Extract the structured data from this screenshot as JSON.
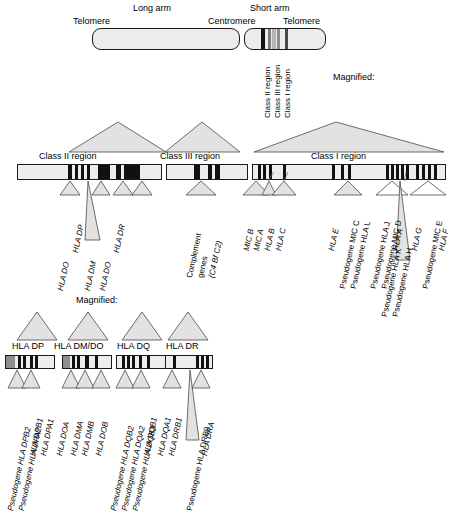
{
  "figure": {
    "title_words": {
      "magnified_1": "Magnified:",
      "magnified_2": "Magnified:"
    }
  },
  "chromosome": {
    "labels": {
      "long_arm": "Long arm",
      "short_arm": "Short arm",
      "telomere_left": "Telomere",
      "centromere": "Centromere",
      "telomere_right": "Telomere"
    },
    "band_labels": [
      "Class II region",
      "Class III region",
      "Class I region"
    ]
  },
  "regions": {
    "class_ii": {
      "title": "Class II region",
      "genes": [
        "HLA DO",
        "HLA DP",
        "HLA DM",
        "HLA DO",
        "HLA DR"
      ]
    },
    "class_iii": {
      "title": "Class III region",
      "genes": [
        "Complement genes (C4 Bf C2)"
      ],
      "gene_line1": "Complement",
      "gene_line2": "genes",
      "gene_line3": "(C4 Bf C2)"
    },
    "class_i": {
      "title": "Class I region",
      "genes": [
        "MIC B",
        "MIC A",
        "HLA B",
        "HLA C",
        "HLA E",
        "Pseudogene MIC C",
        "Pseudogene HLA L",
        "Pseudogene HLA J",
        "Pseudogene MIC D",
        "HLA A",
        "Pseudogene HLA K",
        "Pseudogene HLA H",
        "HLA G",
        "Pseudogene MIC E",
        "HLA F"
      ]
    }
  },
  "magnified_clusters": [
    {
      "name": "HLA DP",
      "genes": [
        "Pseudogene HLA DPB2",
        "Pseudogene HLA DPA2",
        "HLA DPB1",
        "HLA DPA1"
      ]
    },
    {
      "name": "HLA DM/DO",
      "genes": [
        "HLA DOA",
        "HLA DMA",
        "HLA DMB",
        "HLA DOB"
      ]
    },
    {
      "name": "HLA DQ",
      "genes": [
        "Pseudogene HLA DQB2",
        "Pseudogene HLA DQA2",
        "Pseudogene HLA DQB3",
        "HLA DQB1",
        "HLA DQA1"
      ]
    },
    {
      "name": "HLA DR",
      "genes": [
        "HLA DRB1",
        "Pseudogene HLA DRB9",
        "HLA DRA"
      ]
    }
  ],
  "colors": {
    "gene_band": "#111111",
    "chromosome_fill": "#ececec",
    "triangle_fill": "#e2e2e2",
    "outline": "#1a1a1a"
  }
}
